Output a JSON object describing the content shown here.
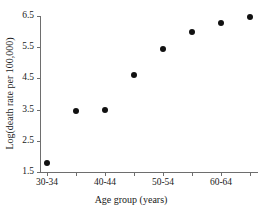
{
  "chart_data": {
    "type": "scatter",
    "title": "",
    "xlabel": "Age group (years)",
    "ylabel": "Log(death rate per 100,000)",
    "categories": [
      "30-34",
      "35-39",
      "40-44",
      "45-49",
      "50-54",
      "55-59",
      "60-64",
      "65-69"
    ],
    "x": [
      1,
      2,
      3,
      4,
      5,
      6,
      7,
      8
    ],
    "values": [
      1.78,
      3.47,
      3.48,
      4.62,
      5.45,
      5.98,
      6.28,
      6.48
    ],
    "series": [
      {
        "name": "Log death rate",
        "points": [
          {
            "category": "30-34",
            "x": 1,
            "y": 1.78
          },
          {
            "category": "35-39",
            "x": 2,
            "y": 3.47
          },
          {
            "category": "40-44",
            "x": 3,
            "y": 3.48
          },
          {
            "category": "45-49",
            "x": 4,
            "y": 4.62
          },
          {
            "category": "50-54",
            "x": 5,
            "y": 5.45
          },
          {
            "category": "55-59",
            "x": 6,
            "y": 5.98
          },
          {
            "category": "60-64",
            "x": 7,
            "y": 6.28
          },
          {
            "category": "65-69",
            "x": 8,
            "y": 6.48
          }
        ]
      }
    ],
    "ylim": [
      1.5,
      6.5
    ],
    "ytick_values": [
      1.5,
      2.5,
      3.5,
      4.5,
      5.5,
      6.5
    ],
    "ytick_labels": [
      "1.5",
      "2.5",
      "3.5",
      "4.5",
      "5.5",
      "6.5"
    ],
    "xtick_labels_shown": [
      "30-34",
      "40-44",
      "50-54",
      "60-64"
    ],
    "xtick_label_positions": [
      1,
      3,
      5,
      7
    ],
    "grid": false,
    "legend": "none",
    "marker": "filled-circle",
    "marker_color": "#111111",
    "axis_color": "#6e6e6e"
  },
  "axes": {
    "y_title": "Log(death rate per 100,000)",
    "x_title": "Age group (years)",
    "y_ticks": [
      {
        "label": "6.5",
        "value": 6.5
      },
      {
        "label": "5.5",
        "value": 5.5
      },
      {
        "label": "4.5",
        "value": 4.5
      },
      {
        "label": "3.5",
        "value": 3.5
      },
      {
        "label": "2.5",
        "value": 2.5
      },
      {
        "label": "1.5",
        "value": 1.5
      }
    ],
    "x_ticks": [
      {
        "label": "30-34",
        "index": 1
      },
      {
        "label": "",
        "index": 2
      },
      {
        "label": "40-44",
        "index": 3
      },
      {
        "label": "",
        "index": 4
      },
      {
        "label": "50-54",
        "index": 5
      },
      {
        "label": "",
        "index": 6
      },
      {
        "label": "60-64",
        "index": 7
      },
      {
        "label": "",
        "index": 8
      }
    ]
  }
}
